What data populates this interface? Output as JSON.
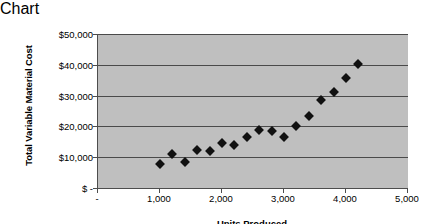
{
  "chart_data": {
    "type": "scatter",
    "title": "",
    "xlabel": "Units Produced",
    "ylabel": "Total Variable Material Cost",
    "xlim": [
      0,
      5000
    ],
    "ylim": [
      0,
      50000
    ],
    "grid": true,
    "legend": false,
    "plot_background": "#bfbfbf",
    "marker_color": "#111111",
    "marker_shape": "diamond",
    "x_tick_labels": [
      "-",
      "1,000",
      "2,000",
      "3,000",
      "4,000",
      "5,000"
    ],
    "x_tick_values": [
      0,
      1000,
      2000,
      3000,
      4000,
      5000
    ],
    "y_tick_labels": [
      "$ -",
      "$10,000",
      "$20,000",
      "$30,000",
      "$40,000",
      "$50,000"
    ],
    "y_tick_values": [
      0,
      10000,
      20000,
      30000,
      40000,
      50000
    ],
    "points": [
      {
        "x": 1000,
        "y": 7700
      },
      {
        "x": 1200,
        "y": 11000
      },
      {
        "x": 1400,
        "y": 8400
      },
      {
        "x": 1600,
        "y": 12400
      },
      {
        "x": 1800,
        "y": 11900
      },
      {
        "x": 2000,
        "y": 14700
      },
      {
        "x": 2200,
        "y": 14100
      },
      {
        "x": 2400,
        "y": 16500
      },
      {
        "x": 2600,
        "y": 18700
      },
      {
        "x": 2800,
        "y": 18400
      },
      {
        "x": 3000,
        "y": 16700
      },
      {
        "x": 3200,
        "y": 20000
      },
      {
        "x": 3400,
        "y": 23500
      },
      {
        "x": 3600,
        "y": 28600
      },
      {
        "x": 3800,
        "y": 31300
      },
      {
        "x": 4000,
        "y": 35800
      },
      {
        "x": 4200,
        "y": 40300
      }
    ]
  }
}
